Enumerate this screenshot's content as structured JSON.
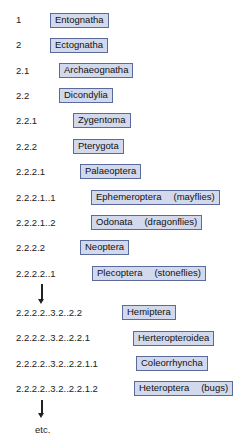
{
  "rows": [
    {
      "code": "1",
      "name": "Entognatha",
      "common": ""
    },
    {
      "code": "2",
      "name": "Ectognatha",
      "common": ""
    },
    {
      "code": "2.1",
      "name": "Archaeognatha",
      "common": ""
    },
    {
      "code": "2.2",
      "name": "Dicondylia",
      "common": ""
    },
    {
      "code": "2.2.1",
      "name": "Zygentoma",
      "common": ""
    },
    {
      "code": "2.2.2",
      "name": "Pterygota",
      "common": ""
    },
    {
      "code": "2.2.2.1",
      "name": "Palaeoptera",
      "common": ""
    },
    {
      "code": "2.2.2.1..1",
      "name": "Ephemeroptera",
      "common": "(mayflies)"
    },
    {
      "code": "2.2.2.1..2",
      "name": "Odonata",
      "common": "(dragonflies)"
    },
    {
      "code": "2.2.2.2",
      "name": "Neoptera",
      "common": ""
    },
    {
      "code": "2.2.2.2..1",
      "name": "Plecoptera",
      "common": "(stoneflies)"
    },
    {
      "code": "2.2.2.2..3.2..2.2",
      "name": "Hemiptera",
      "common": ""
    },
    {
      "code": "2.2.2.2..3.2..2.2.1",
      "name": "Herteropteroidea",
      "common": ""
    },
    {
      "code": "2.2.2.2..3.2..2.2.1.1",
      "name": "Coleorrhyncha",
      "common": ""
    },
    {
      "code": "2.2.2.2..3.2..2.2.1.2",
      "name": "Heteroptera",
      "common": "(bugs)"
    }
  ],
  "footer": {
    "etc_label": "etc."
  },
  "colors": {
    "box_fill": "#d3d9ec",
    "box_border": "#5a6a9a"
  }
}
